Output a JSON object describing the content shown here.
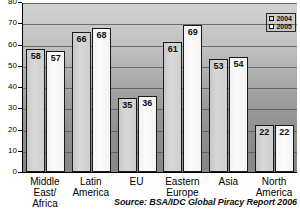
{
  "chart_data": {
    "type": "bar",
    "title": "",
    "title_cropped": true,
    "xlabel": "",
    "ylabel": "",
    "ylim": [
      0,
      80
    ],
    "ytick_step": 10,
    "yticks": [
      "80",
      "70",
      "60",
      "50",
      "40",
      "30",
      "20",
      "10",
      "0"
    ],
    "grid": true,
    "legend_position": "top-right",
    "categories": [
      "Middle\nEast/\nAfrica",
      "Latin\nAmerica",
      "EU",
      "Eastern\nEurope",
      "Asia",
      "North\nAmerica"
    ],
    "series": [
      {
        "name": "2004",
        "values": [
          58,
          66,
          35,
          61,
          53,
          22
        ],
        "color": "#d6d6d6"
      },
      {
        "name": "2005",
        "values": [
          57,
          68,
          36,
          69,
          54,
          22
        ],
        "color": "#fcfcfc"
      }
    ],
    "annotations": {
      "source": "Source: BSA/IDC Global Piracy Report 2006"
    }
  },
  "legend": {
    "items": [
      {
        "label": "2004"
      },
      {
        "label": "2005"
      }
    ]
  }
}
